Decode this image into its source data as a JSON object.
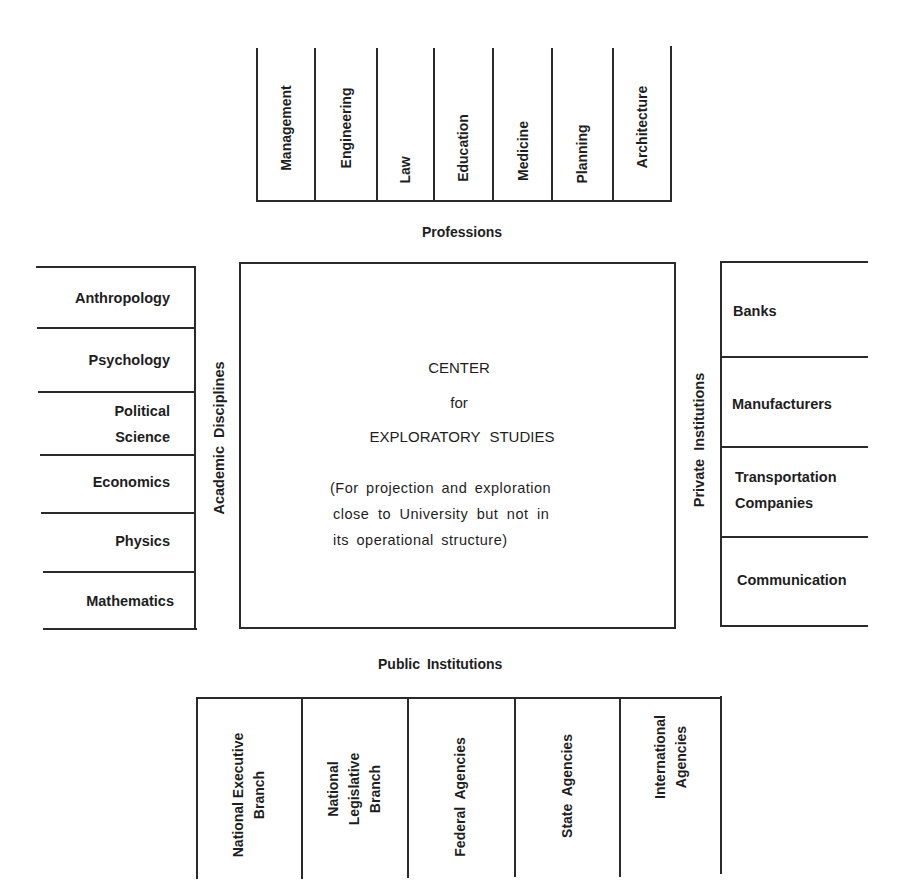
{
  "professions": {
    "title": "Professions",
    "items": [
      "Management",
      "Engineering",
      "Law",
      "Education",
      "Medicine",
      "Planning",
      "Architecture"
    ]
  },
  "academic_disciplines": {
    "title": "Academic Disciplines",
    "items": [
      "Anthropology",
      "Psychology",
      "Political\nScience",
      "Economics",
      "Physics",
      "Mathematics"
    ]
  },
  "center": {
    "line1": "CENTER",
    "line2": "for",
    "line3": "EXPLORATORY STUDIES",
    "desc1": "(For projection and exploration",
    "desc2": "close to University but not in",
    "desc3": "its operational structure)"
  },
  "private_institutions": {
    "title": "Private Institutions",
    "items": [
      "Banks",
      "Manufacturers",
      "Transportation\nCompanies",
      "Communication"
    ]
  },
  "public_institutions": {
    "title": "Public Institutions",
    "items": [
      "National Executive\nBranch",
      "National\nLegislative\nBranch",
      "Federal Agencies",
      "State Agencies",
      "International\nAgencies"
    ]
  }
}
